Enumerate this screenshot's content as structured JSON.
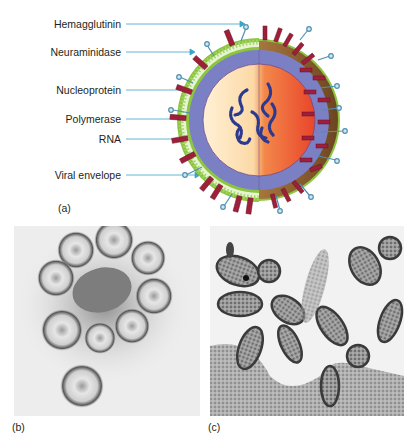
{
  "figure": {
    "panel_a": {
      "tag": "(a)",
      "labels": [
        {
          "text": "Hemagglutinin",
          "y": 24
        },
        {
          "text": "Neuraminidase",
          "y": 52
        },
        {
          "text": "Nucleoprotein",
          "y": 90
        },
        {
          "text": "Polymerase",
          "y": 119
        },
        {
          "text": "RNA",
          "y": 139
        },
        {
          "text": "Viral envelope",
          "y": 175
        }
      ],
      "colors": {
        "leader_line": "#3aa3c8",
        "envelope_green": "#8cc63f",
        "matrix_purple": "#7b7fc4",
        "core_light": "#fde3b8",
        "core_orange": "#ee5a2a",
        "hemagglutinin_spike": "#9e1f3a",
        "neuraminidase_tip": "#cfe8f3",
        "rna_strand": "#2b3a8f",
        "outer_shell_brown": "#8a5a2b"
      }
    },
    "panel_b": {
      "tag": "(b)"
    },
    "panel_c": {
      "tag": "(c)"
    }
  }
}
